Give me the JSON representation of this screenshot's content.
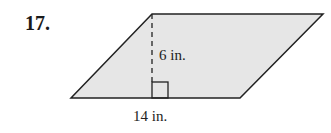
{
  "problem": {
    "number": "17.",
    "shape": "parallelogram",
    "height_label": "6 in.",
    "base_label": "14 in.",
    "fill_color": "#e6e6e6",
    "stroke_color": "#222222"
  }
}
